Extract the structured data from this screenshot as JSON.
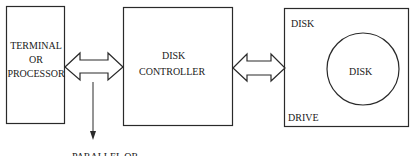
{
  "diagram": {
    "nodes": [
      {
        "id": "terminal",
        "lines": [
          "TERMINAL",
          "OR",
          "PROCESSOR"
        ]
      },
      {
        "id": "controller",
        "lines": [
          "DISK",
          "CONTROLLER"
        ]
      },
      {
        "id": "drive",
        "top_label": "DISK",
        "bottom_label": "DRIVE",
        "inner_label": "DISK"
      }
    ],
    "edges": [
      {
        "from": "terminal",
        "to": "controller",
        "type": "bidirectional"
      },
      {
        "from": "controller",
        "to": "drive",
        "type": "bidirectional"
      }
    ],
    "branch": {
      "label": "PARALLEL OR"
    }
  },
  "colors": {
    "stroke": "#2a2a2a",
    "background": "#ffffff"
  }
}
